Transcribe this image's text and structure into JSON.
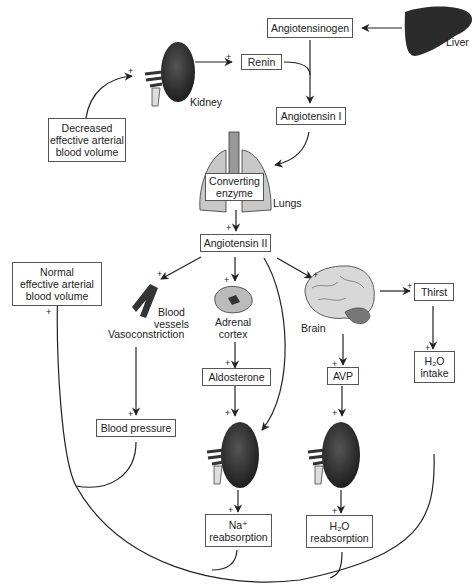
{
  "boxes": {
    "angiotensinogen": "Angiotensinogen",
    "renin": "Renin",
    "angiotensin_i": "Angiotensin I",
    "decreased_volume": [
      "Decreased",
      "effective arterial",
      "blood volume"
    ],
    "converting_enzyme": [
      "Converting",
      "enzyme"
    ],
    "angiotensin_ii": "Angiotensin II",
    "normal_volume": [
      "Normal",
      "effective arterial",
      "blood volume"
    ],
    "aldosterone": "Aldosterone",
    "avp": "AVP",
    "thirst": "Thirst",
    "h2o_intake": [
      "H₂O",
      "intake"
    ],
    "blood_pressure": "Blood pressure",
    "na_reabsorption": [
      "Na⁺",
      "reabsorption"
    ],
    "h2o_reabsorption": [
      "H₂O",
      "reabsorption"
    ]
  },
  "labels": {
    "liver": "Liver",
    "kidney": "Kidney",
    "lungs": "Lungs",
    "blood_vessels": [
      "Blood",
      "vessels"
    ],
    "vasoconstriction": "Vasoconstriction",
    "adrenal_cortex": [
      "Adrenal",
      "cortex"
    ],
    "brain": "Brain"
  },
  "plus_sign": "+",
  "icons": [
    "liver-icon",
    "kidney-icon",
    "lungs-icon",
    "blood-vessel-icon",
    "adrenal-cortex-icon",
    "brain-icon",
    "kidney-icon",
    "kidney-icon"
  ],
  "colors": {
    "organ_dark": "#2b2b2b",
    "organ_light": "#c8c8c8",
    "line": "#222222",
    "box_border": "#555555"
  }
}
